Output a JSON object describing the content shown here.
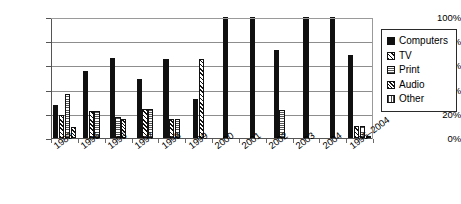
{
  "chart_data": {
    "type": "bar",
    "title": "",
    "subtitle": "",
    "xlabel": "",
    "ylabel": "",
    "ylim": [
      0,
      100
    ],
    "yticks": [
      "0%",
      "20%",
      "40%",
      "60%",
      "80%",
      "100%"
    ],
    "ytick_values": [
      0,
      20,
      40,
      60,
      80,
      100
    ],
    "grid": true,
    "legend_position": "right",
    "categories": [
      "1983",
      "1995",
      "1996",
      "1997",
      "1998",
      "1999",
      "2000",
      "2001",
      "2002",
      "2003",
      "2004",
      "1995–2004"
    ],
    "series": [
      {
        "name": "Computers",
        "pattern": "solid-black",
        "values": [
          27,
          55,
          66,
          49,
          65,
          32,
          100,
          100,
          73,
          100,
          100,
          69
        ]
      },
      {
        "name": "TV",
        "pattern": "diagonal-hatch",
        "values": [
          19,
          22,
          null,
          24,
          16,
          65,
          null,
          null,
          null,
          null,
          null,
          10
        ]
      },
      {
        "name": "Print",
        "pattern": "horizontal-dotted",
        "values": [
          36,
          22,
          17,
          24,
          16,
          null,
          null,
          null,
          23,
          null,
          null,
          10
        ]
      },
      {
        "name": "Audio",
        "pattern": "crosshatch",
        "values": [
          9,
          null,
          16,
          null,
          null,
          null,
          null,
          null,
          null,
          null,
          null,
          null
        ]
      },
      {
        "name": "Other",
        "pattern": "vertical-lines",
        "values": [
          null,
          null,
          null,
          null,
          null,
          null,
          null,
          null,
          null,
          null,
          null,
          2
        ]
      }
    ]
  },
  "legend": {
    "items": [
      {
        "label": "Computers"
      },
      {
        "label": "TV"
      },
      {
        "label": "Print"
      },
      {
        "label": "Audio"
      },
      {
        "label": "Other"
      }
    ]
  }
}
